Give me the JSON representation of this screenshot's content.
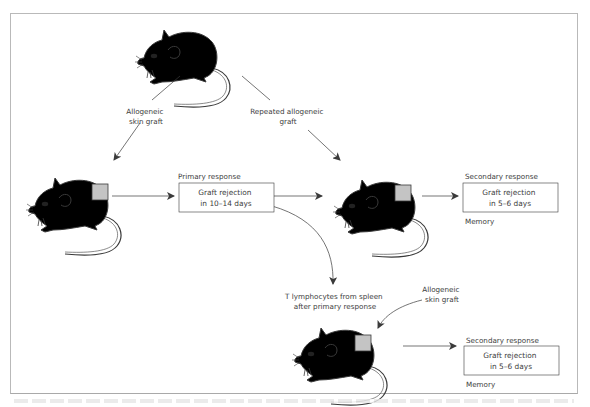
{
  "figure": {
    "colors": {
      "donor_mouse": "#9a9a9a",
      "donor_patch": "#000000",
      "recipient_mouse": "#ffffff",
      "graft_patch": "#c4c4c4",
      "line": "#3a3a3a",
      "frame": "#b9b9b9"
    },
    "donor": {
      "label": "donor-mouse"
    },
    "arrows": {
      "allogeneic_graft_1": [
        "Allogeneic",
        "skin graft"
      ],
      "repeated_graft": [
        "Repeated allogeneic",
        "graft"
      ],
      "t_cell_transfer": [
        "T lymphocytes from spleen",
        "after primary response"
      ],
      "allogeneic_graft_2": [
        "Allogeneic",
        "skin graft"
      ]
    },
    "primary": {
      "heading": "Primary response",
      "box": [
        "Graft rejection",
        "in 10–14 days"
      ]
    },
    "secondary_top": {
      "heading": "Secondary response",
      "box": [
        "Graft rejection",
        "in 5–6 days"
      ],
      "footer": "Memory"
    },
    "secondary_bottom": {
      "heading": "Secondary response",
      "box": [
        "Graft rejection",
        "in 5–6 days"
      ],
      "footer": "Memory"
    }
  }
}
